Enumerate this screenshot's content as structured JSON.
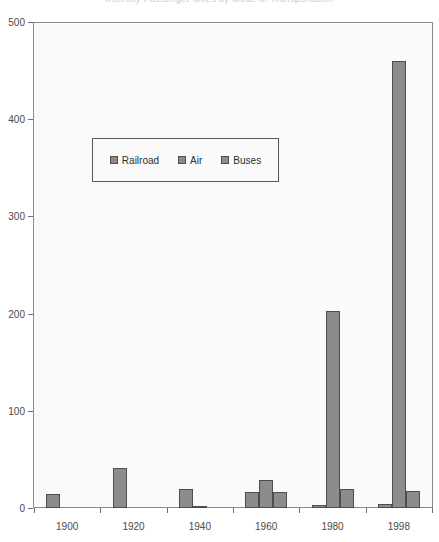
{
  "chart_data": {
    "type": "bar",
    "title": "Intercity Passenger Miles by Mode of Transportation",
    "xlabel": "",
    "ylabel": "",
    "categories": [
      "1900",
      "1920",
      "1940",
      "1960",
      "1980",
      "1998"
    ],
    "ylim": [
      0,
      500
    ],
    "yticks": [
      0,
      100,
      200,
      300,
      400,
      500
    ],
    "grid": false,
    "legend_position": "inside-upper-left",
    "series": [
      {
        "name": "Railroad",
        "values": [
          14,
          41,
          20,
          16,
          3,
          4
        ]
      },
      {
        "name": "Air",
        "values": [
          0,
          0,
          1,
          29,
          203,
          461
        ]
      },
      {
        "name": "Buses",
        "values": [
          0,
          0,
          0,
          17,
          20,
          18
        ]
      }
    ]
  },
  "axes": {
    "y_tick_labels": [
      "0",
      "100",
      "200",
      "300",
      "400",
      "500"
    ],
    "x_tick_labels": [
      "1900",
      "1920",
      "1940",
      "1960",
      "1980",
      "1998"
    ]
  },
  "legend": {
    "entries": [
      {
        "label": "Railroad",
        "color": "#8c8c8c"
      },
      {
        "label": "Air",
        "color": "#8c8c8c"
      },
      {
        "label": "Buses",
        "color": "#8c8c8c"
      }
    ]
  },
  "colors": {
    "bar_fill": "#8c8c8c",
    "bar_border": "#4d4d4d",
    "plot_background": "#fafafa",
    "axis_line": "#8a8a8a",
    "tick_text": "#4a4a4a"
  }
}
